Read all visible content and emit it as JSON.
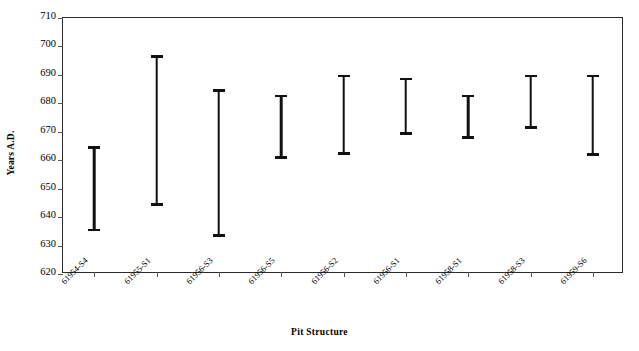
{
  "chart_data": {
    "type": "bar",
    "title": "",
    "xlabel": "Pit Structure",
    "ylabel": "Years A.D.",
    "ylim": [
      620,
      710
    ],
    "ytick_step": 10,
    "yticks": [
      710,
      700,
      690,
      680,
      670,
      660,
      650,
      640,
      630,
      620
    ],
    "grid": false,
    "legend": null,
    "categories": [
      "61954-S4",
      "61955-S1",
      "61956-S3",
      "61956-S5",
      "61956-S2",
      "61956-S1",
      "61958-S1",
      "61958-S3",
      "61959-S6"
    ],
    "series": [
      {
        "name": "Date range",
        "low": [
          635,
          644,
          633,
          660.5,
          662,
          669,
          667.5,
          671,
          661.5
        ],
        "high": [
          665,
          697,
          685,
          683,
          690,
          689,
          683,
          690,
          690
        ]
      }
    ],
    "marker_color": "#111111",
    "axis_color": "#2b2b2b",
    "background": "#ffffff"
  }
}
